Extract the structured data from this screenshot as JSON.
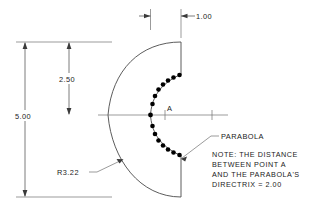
{
  "drawing": {
    "title": "Parabola Profile Part Drawing",
    "background_color": "#ffffff",
    "line_color": "#5a5a5a",
    "text_color": "#1a1a1a",
    "dimensions": {
      "overall_height": "5.00",
      "half_height": "2.50",
      "top_width": "1.00",
      "radius": "R3.22"
    },
    "labels": {
      "point_a": "A",
      "parabola": "PARABOLA"
    },
    "note": {
      "line1": "NOTE: THE DISTANCE",
      "line2": "BETWEEN POINT A",
      "line3": "AND THE PARABOLA'S",
      "line4": "DIRECTRIX = 2.00"
    },
    "geometry": {
      "parabola_dots_upper": [
        [
          150.5,
          115.0
        ],
        [
          152.5,
          104.0
        ],
        [
          155.0,
          96.0
        ],
        [
          158.5,
          89.5
        ],
        [
          163.0,
          84.5
        ],
        [
          168.0,
          80.5
        ],
        [
          173.5,
          77.5
        ],
        [
          179.5,
          75.0
        ]
      ],
      "parabola_dots_lower": [
        [
          150.5,
          115.0
        ],
        [
          152.5,
          126.0
        ],
        [
          155.0,
          134.0
        ],
        [
          158.5,
          140.5
        ],
        [
          163.0,
          145.5
        ],
        [
          168.0,
          149.5
        ],
        [
          173.5,
          152.5
        ],
        [
          179.5,
          155.0
        ]
      ],
      "centerline_y": 115,
      "top_edge_y": 42,
      "bottom_edge_y": 197,
      "right_edge_x": 181,
      "arc_radius_px": 104
    }
  }
}
